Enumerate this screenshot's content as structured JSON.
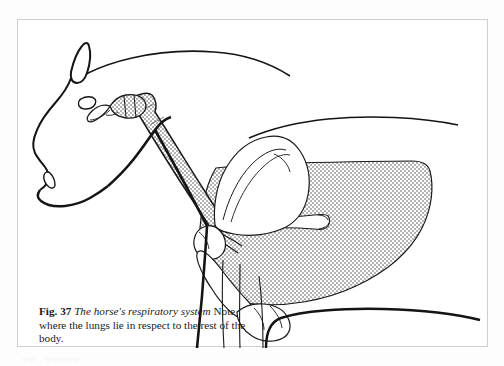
{
  "page": {
    "background_color": "#fdfdfd",
    "bleed_text": "ww . wwwww"
  },
  "figure": {
    "frame": {
      "border_color": "#cfcfcf",
      "background_color": "#ffffff"
    },
    "caption": {
      "number_label": "Fig. 37",
      "title": "The horse's respiratory system",
      "note": "Note where the lungs lie in respect to the rest of the body."
    },
    "illustration": {
      "subject": "horse-head-neck-and-chest-anatomy",
      "style": "line-drawing-with-stipple-shading",
      "ink_color": "#111111",
      "stipple_color": "#b7b7b7",
      "stipple_background": "#ffffff",
      "parts": [
        {
          "name": "horse-body-outline",
          "shading": "none"
        },
        {
          "name": "ear",
          "shading": "none"
        },
        {
          "name": "eye",
          "shading": "none"
        },
        {
          "name": "nostril",
          "shading": "none"
        },
        {
          "name": "larynx",
          "shading": "stipple"
        },
        {
          "name": "trachea",
          "shading": "stipple"
        },
        {
          "name": "lung",
          "shading": "stipple"
        },
        {
          "name": "bronchus",
          "shading": "none"
        },
        {
          "name": "scapula",
          "shading": "none"
        },
        {
          "name": "humerus",
          "shading": "none"
        },
        {
          "name": "elbow-joint",
          "shading": "none"
        },
        {
          "name": "foreleg",
          "shading": "none"
        }
      ]
    }
  }
}
